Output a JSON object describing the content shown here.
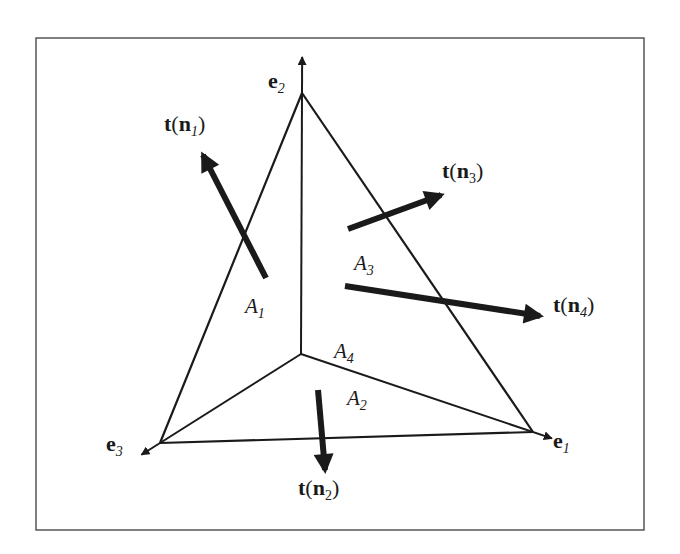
{
  "figure": {
    "frame": {
      "x": 36,
      "y": 38,
      "width": 608,
      "height": 492
    },
    "colors": {
      "ink": "#1a1a1a",
      "frame": "#555555",
      "background": "#ffffff"
    }
  },
  "axes": [
    {
      "name": "e2",
      "base": "e",
      "sub": "2",
      "label_pos": [
        268,
        70
      ]
    },
    {
      "name": "e1",
      "base": "e",
      "sub": "1",
      "label_pos": [
        553,
        430
      ]
    },
    {
      "name": "e3",
      "base": "e",
      "sub": "3",
      "label_pos": [
        106,
        433
      ]
    }
  ],
  "tetrahedron": {
    "origin": [
      301,
      354
    ],
    "vertex_e2": [
      302,
      93
    ],
    "vertex_e1": [
      533,
      432
    ],
    "vertex_e3": [
      160,
      443
    ]
  },
  "areas": [
    {
      "name": "A1",
      "base": "A",
      "sub": "1",
      "pos": [
        245,
        296
      ]
    },
    {
      "name": "A2",
      "base": "A",
      "sub": "2",
      "pos": [
        347,
        388
      ]
    },
    {
      "name": "A3",
      "base": "A",
      "sub": "3",
      "pos": [
        354,
        253
      ]
    },
    {
      "name": "A4",
      "base": "A",
      "sub": "4",
      "pos": [
        334,
        341
      ]
    }
  ],
  "tractions": [
    {
      "name": "t-n1",
      "t": "t",
      "n": "n",
      "sub": "1",
      "label_pos": [
        164,
        113
      ],
      "from": [
        266,
        278
      ],
      "to": [
        203,
        155
      ]
    },
    {
      "name": "t-n2",
      "t": "t",
      "n": "n",
      "sub": "2",
      "label_pos": [
        298,
        477
      ],
      "from": [
        318,
        390
      ],
      "to": [
        325,
        470
      ]
    },
    {
      "name": "t-n3",
      "t": "t",
      "n": "n",
      "sub": "3",
      "label_pos": [
        442,
        160
      ],
      "from": [
        348,
        229
      ],
      "to": [
        441,
        195
      ]
    },
    {
      "name": "t-n4",
      "t": "t",
      "n": "n",
      "sub": "4",
      "label_pos": [
        553,
        294
      ],
      "from": [
        345,
        286
      ],
      "to": [
        540,
        316
      ]
    }
  ],
  "text": {
    "open_paren": "(",
    "close_paren": ")"
  }
}
